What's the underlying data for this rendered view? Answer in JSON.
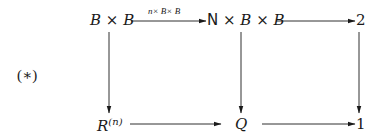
{
  "diagram": {
    "tag": "(∗)",
    "nodes": {
      "top_left": "B × B",
      "top_middle_prefix": "N",
      "top_middle_rest": " × B × B",
      "top_right": "2",
      "bottom_left_base": "R",
      "bottom_left_sup": "(n)",
      "bottom_middle": "Q",
      "bottom_right": "1"
    },
    "arrows": {
      "top_left_to_top_middle": {
        "label": "n× B× B"
      },
      "top_middle_to_top_right": {
        "label": ""
      },
      "top_left_to_bottom_left": {
        "label": ""
      },
      "top_middle_to_bottom_middle": {
        "label": ""
      },
      "top_right_to_bottom_right": {
        "label": ""
      },
      "bottom_left_to_bottom_middle": {
        "label": ""
      },
      "bottom_middle_to_bottom_right": {
        "label": ""
      }
    },
    "colors": {
      "ink": "#1a1a1a",
      "background": "#ffffff"
    }
  }
}
